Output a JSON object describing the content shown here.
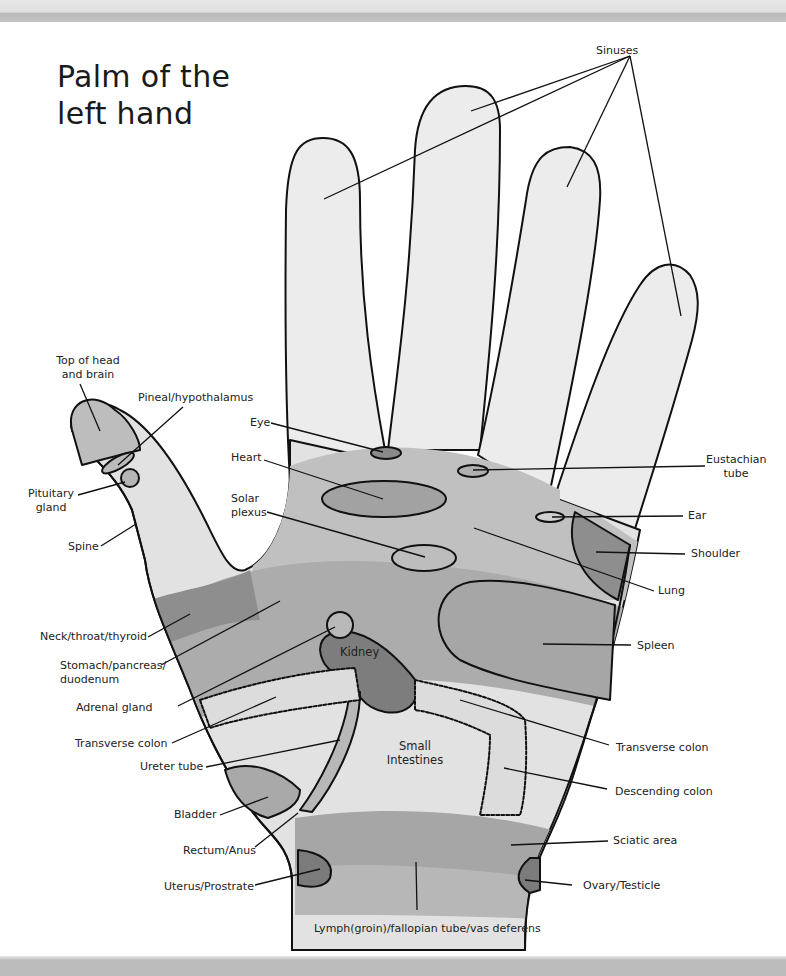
{
  "title": {
    "line1": "Palm of the",
    "line2": "left hand"
  },
  "colors": {
    "finger_fill": "#ececec",
    "palm_mid": "#bdbdbd",
    "palm_dark": "#a8a8a8",
    "organ_dark": "#7d7d7d",
    "outline": "#111111",
    "bar": "#c0c0c0"
  },
  "labels": {
    "sinuses": "Sinuses",
    "top_of_head_1": "Top of head",
    "top_of_head_2": "and brain",
    "pineal": "Pineal/hypothalamus",
    "eye": "Eye",
    "heart": "Heart",
    "pituitary_1": "Pituitary",
    "pituitary_2": "gland",
    "solar_1": "Solar",
    "solar_2": "plexus",
    "spine": "Spine",
    "neck": "Neck/throat/thyroid",
    "stomach_1": "Stomach/pancreas/",
    "stomach_2": "duodenum",
    "adrenal": "Adrenal gland",
    "transverse_left": "Transverse colon",
    "ureter": "Ureter tube",
    "bladder": "Bladder",
    "rectum": "Rectum/Anus",
    "uterus": "Uterus/Prostrate",
    "lymph": "Lymph(groin)/fallopian tube/vas deferens",
    "eustachian_1": "Eustachian",
    "eustachian_2": "tube",
    "ear": "Ear",
    "shoulder": "Shoulder",
    "lung": "Lung",
    "spleen": "Spleen",
    "transverse_right": "Transverse colon",
    "descending": "Descending colon",
    "sciatic": "Sciatic area",
    "ovary": "Ovary/Testicle",
    "kidney": "Kidney",
    "small_int_1": "Small",
    "small_int_2": "Intestines"
  }
}
